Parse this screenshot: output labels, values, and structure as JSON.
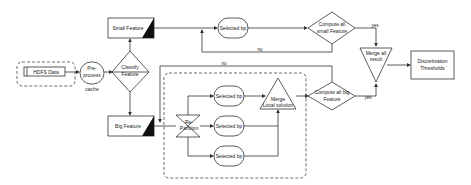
{
  "diagram": {
    "nodes": {
      "hdfs": "HDFS Data",
      "preprocess_1": "Pre-",
      "preprocess_2": "process",
      "cache": "cache",
      "classify_1": "Classify",
      "classify_2": "Feature",
      "small_feature": "Small Feature",
      "big_feature": "Big Feature",
      "selected_top": "Selected bp",
      "compute_small_1": "Compute all",
      "compute_small_2": "small Feature",
      "repartition_1": "Re-",
      "repartition_2": "Partition",
      "selected_1": "Selected bp",
      "selected_2": "Selected bp",
      "selected_3": "Selected bp",
      "merge_local_1": "Merge",
      "merge_local_2": "Local solution",
      "compute_big_1": "Compute all big",
      "compute_big_2": "Feature",
      "merge_all_1": "Merge all",
      "merge_all_2": "result",
      "output_1": "Discretization",
      "output_2": "Thresholds"
    },
    "edge_labels": {
      "yes_small": "yes",
      "yes_big": "yes",
      "no_small": "no",
      "no_big": "no"
    },
    "colors": {
      "stroke": "#333333",
      "fill": "#ffffff",
      "corner": "#111111"
    }
  }
}
